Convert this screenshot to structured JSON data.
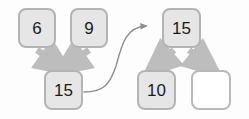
{
  "diagram": {
    "canvas": {
      "width": 249,
      "height": 119
    },
    "colors": {
      "background": "#fdfdfd",
      "node_fill": "#e6e6e6",
      "node_fill_empty": "#ffffff",
      "node_border": "#b4b4b4",
      "arrow_thick": "#bdbdbd",
      "arrow_thin": "#8e8e8e",
      "label_text": "#1b1b1b"
    },
    "nodes": [
      {
        "id": "n6",
        "label": "6",
        "empty": false,
        "x": 18,
        "y": 8,
        "w": 38,
        "h": 40
      },
      {
        "id": "n9",
        "label": "9",
        "empty": false,
        "x": 70,
        "y": 8,
        "w": 38,
        "h": 40
      },
      {
        "id": "n15a",
        "label": "15",
        "empty": false,
        "x": 44,
        "y": 70,
        "w": 39,
        "h": 40
      },
      {
        "id": "n15b",
        "label": "15",
        "empty": false,
        "x": 162,
        "y": 8,
        "w": 39,
        "h": 40
      },
      {
        "id": "n10",
        "label": "10",
        "empty": false,
        "x": 137,
        "y": 70,
        "w": 39,
        "h": 40
      },
      {
        "id": "nblank",
        "label": "",
        "empty": true,
        "x": 191,
        "y": 70,
        "w": 40,
        "h": 40
      }
    ],
    "edges": [
      {
        "id": "e-6-15a",
        "from": "n6",
        "to": "n15a",
        "style": "thick"
      },
      {
        "id": "e-9-15a",
        "from": "n9",
        "to": "n15a",
        "style": "thick"
      },
      {
        "id": "e-15a-15b",
        "from": "n15a",
        "to": "n15b",
        "style": "curved-thin"
      },
      {
        "id": "e-15b-10",
        "from": "n15b",
        "to": "n10",
        "style": "thick"
      },
      {
        "id": "e-15b-blank",
        "from": "n15b",
        "to": "nblank",
        "style": "thick"
      }
    ]
  }
}
